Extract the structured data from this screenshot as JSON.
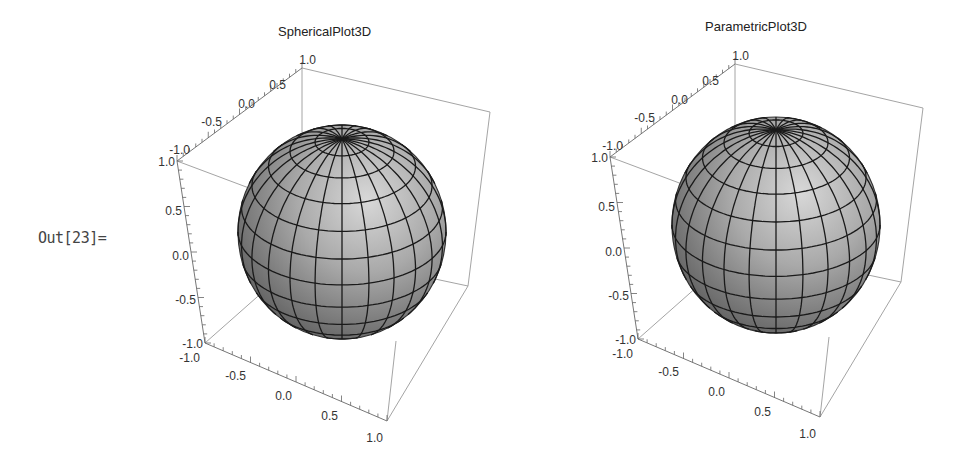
{
  "cell": {
    "out_label": "Out[23]="
  },
  "chart_data": [
    {
      "type": "surface3d",
      "title": "SphericalPlot3D",
      "surface": "unit sphere",
      "mesh": {
        "latitude_lines": 12,
        "longitude_lines": 24
      },
      "xlabel": "",
      "ylabel": "",
      "zlabel": "",
      "x_ticks": [
        "-1.0",
        "-0.5",
        "0.0",
        "0.5",
        "1.0"
      ],
      "y_ticks": [
        "-1.0",
        "-0.5",
        "0.0",
        "0.5",
        "1.0"
      ],
      "z_ticks": [
        "1.0",
        "0.5",
        "0.0",
        "-0.5",
        "-1.0"
      ],
      "xlim": [
        -1,
        1
      ],
      "ylim": [
        -1,
        1
      ],
      "zlim": [
        -1,
        1
      ],
      "boxed": true,
      "surface_color": "#9c9c9c",
      "mesh_color": "#1a1a1a"
    },
    {
      "type": "surface3d",
      "title": "ParametricPlot3D",
      "surface": "unit sphere",
      "mesh": {
        "latitude_lines": 12,
        "longitude_lines": 24
      },
      "xlabel": "",
      "ylabel": "",
      "zlabel": "",
      "x_ticks": [
        "-1.0",
        "-0.5",
        "0.0",
        "0.5",
        "1.0"
      ],
      "y_ticks": [
        "-1.0",
        "-0.5",
        "0.0",
        "0.5",
        "1.0"
      ],
      "z_ticks": [
        "1.0",
        "0.5",
        "0.0",
        "-0.5",
        "-1.0"
      ],
      "xlim": [
        -1,
        1
      ],
      "ylim": [
        -1,
        1
      ],
      "zlim": [
        -1,
        1
      ],
      "boxed": true,
      "surface_color": "#9c9c9c",
      "mesh_color": "#1a1a1a"
    }
  ]
}
